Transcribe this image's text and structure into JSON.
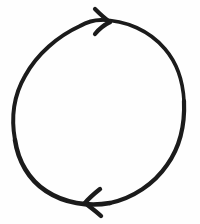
{
  "image": {
    "kind": "hand-drawn-diagram",
    "medium": "pen on white paper",
    "width": 200,
    "height": 224,
    "background_color": "#fefefe",
    "ink_color": "#1b1b1b",
    "description": "A hand-drawn circle with two arrowheads on its outline indicating clockwise rotation",
    "text_content": "",
    "has_text": false
  },
  "diagram": {
    "type": "cycle-arrow",
    "shape_label": "circle",
    "rotation_direction": "clockwise",
    "stroke_color": "#1b1b1b",
    "stroke_width_min": 3,
    "stroke_width_max": 5,
    "circle": {
      "center_x": 99,
      "center_y": 112,
      "radius_x": 85,
      "radius_y": 93,
      "left_edge_x": 14,
      "right_edge_x": 184,
      "top_edge_y": 19,
      "bottom_edge_y": 206
    },
    "arrowheads": [
      {
        "name": "top-arrowhead",
        "position": "top",
        "tip_x": 110,
        "tip_y": 22,
        "points_toward": "right",
        "indicates": "clockwise"
      },
      {
        "name": "bottom-arrowhead",
        "position": "bottom",
        "tip_x": 85,
        "tip_y": 203,
        "points_toward": "left",
        "indicates": "clockwise"
      }
    ]
  }
}
